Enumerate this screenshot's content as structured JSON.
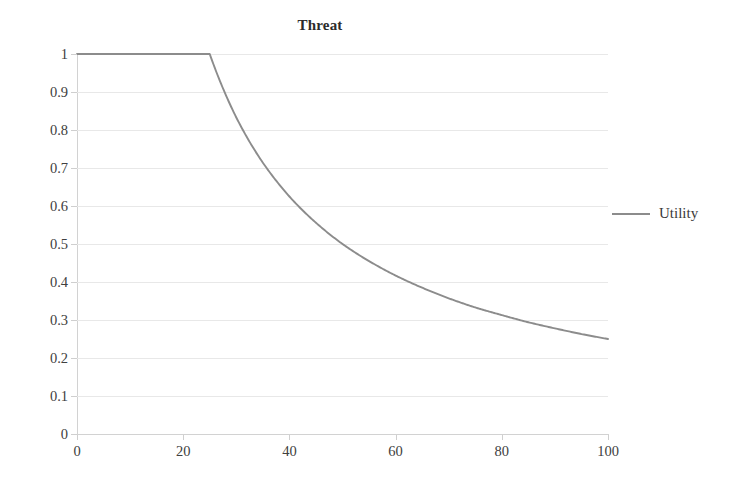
{
  "chart_data": {
    "type": "line",
    "title": "Threat",
    "xlabel": "",
    "ylabel": "",
    "xlim": [
      0,
      100
    ],
    "ylim": [
      0,
      1
    ],
    "grid": true,
    "legend_position": "right",
    "x_ticks": [
      "0",
      "20",
      "40",
      "60",
      "80",
      "100"
    ],
    "x_tick_values": [
      0,
      20,
      40,
      60,
      80,
      100
    ],
    "y_ticks": [
      "0",
      "0.1",
      "0.2",
      "0.3",
      "0.4",
      "0.5",
      "0.6",
      "0.7",
      "0.8",
      "0.9",
      "1"
    ],
    "y_tick_values": [
      0,
      0.1,
      0.2,
      0.3,
      0.4,
      0.5,
      0.6,
      0.7,
      0.8,
      0.9,
      1
    ],
    "series": [
      {
        "name": "Utility",
        "color": "#8c8c8c",
        "x": [
          0,
          5,
          10,
          15,
          20,
          25,
          28,
          30,
          32,
          35,
          38,
          40,
          45,
          50,
          55,
          60,
          65,
          70,
          75,
          80,
          85,
          90,
          95,
          100
        ],
        "values": [
          1,
          1,
          1,
          1,
          1,
          1,
          0.893,
          0.833,
          0.781,
          0.714,
          0.658,
          0.625,
          0.556,
          0.5,
          0.455,
          0.417,
          0.385,
          0.357,
          0.333,
          0.313,
          0.294,
          0.278,
          0.263,
          0.25
        ]
      }
    ],
    "legend": [
      {
        "label": "Utility",
        "color": "#8c8c8c"
      }
    ],
    "annotations": []
  }
}
